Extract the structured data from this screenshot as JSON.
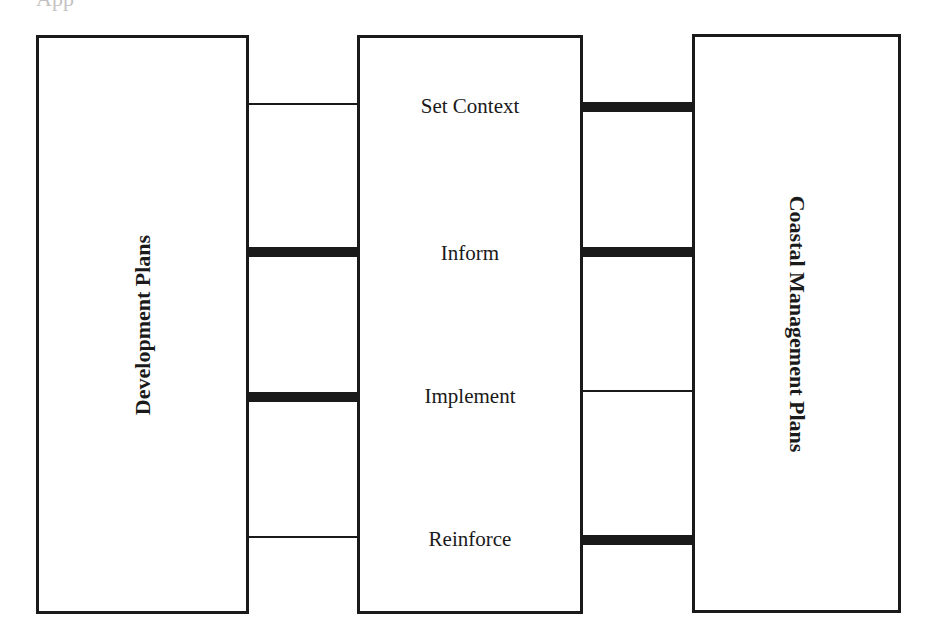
{
  "header_fragment": "App",
  "boxes": {
    "left": {
      "label": "Development Plans"
    },
    "middle": {
      "stages": [
        {
          "label": "Set Context",
          "left_link": "thin",
          "right_link": "thick"
        },
        {
          "label": "Inform",
          "left_link": "thick",
          "right_link": "thick"
        },
        {
          "label": "Implement",
          "left_link": "thick",
          "right_link": "thin"
        },
        {
          "label": "Reinforce",
          "left_link": "thin",
          "right_link": "thick"
        }
      ]
    },
    "right": {
      "label": "Coastal Management Plans"
    }
  },
  "colors": {
    "line": "#1a1a1a",
    "background": "#ffffff"
  }
}
